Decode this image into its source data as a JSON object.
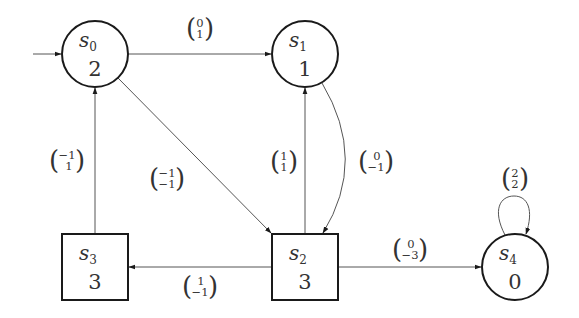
{
  "diagram": {
    "type": "game-graph",
    "colors": {
      "stroke": "#1a1a1a",
      "edge": "#555555",
      "text": "#333333",
      "background": "#ffffff"
    },
    "nodes": [
      {
        "id": "s0",
        "name": "s",
        "sub": "0",
        "value": "2",
        "shape": "circle",
        "initial": true
      },
      {
        "id": "s1",
        "name": "s",
        "sub": "1",
        "value": "1",
        "shape": "circle",
        "initial": false
      },
      {
        "id": "s2",
        "name": "s",
        "sub": "2",
        "value": "3",
        "shape": "square",
        "initial": false
      },
      {
        "id": "s3",
        "name": "s",
        "sub": "3",
        "value": "3",
        "shape": "square",
        "initial": false
      },
      {
        "id": "s4",
        "name": "s",
        "sub": "4",
        "value": "0",
        "shape": "circle",
        "initial": false
      }
    ],
    "edges": [
      {
        "from": "s0",
        "to": "s1",
        "top": "0",
        "bottom": "1"
      },
      {
        "from": "s0",
        "to": "s2",
        "top": "−1",
        "bottom": "−1"
      },
      {
        "from": "s3",
        "to": "s0",
        "top": "−1",
        "bottom": "1"
      },
      {
        "from": "s2",
        "to": "s1",
        "top": "1",
        "bottom": "1"
      },
      {
        "from": "s1",
        "to": "s2",
        "top": "0",
        "bottom": "−1"
      },
      {
        "from": "s2",
        "to": "s3",
        "top": "1",
        "bottom": "−1"
      },
      {
        "from": "s2",
        "to": "s4",
        "top": "0",
        "bottom": "−3"
      },
      {
        "from": "s4",
        "to": "s4",
        "top": "2",
        "bottom": "2"
      }
    ]
  }
}
